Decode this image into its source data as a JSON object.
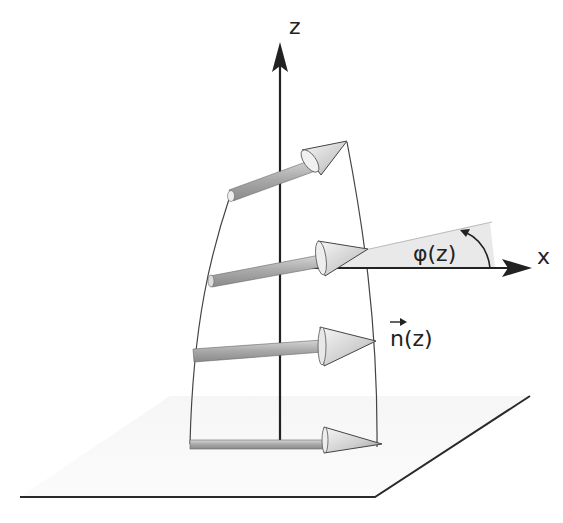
{
  "diagram": {
    "type": "twisted director field along z axis",
    "labels": {
      "z_axis": "z",
      "x_axis": "x",
      "angle": "φ(z)",
      "director": "n(z)"
    },
    "elements": {
      "axes": [
        "z (vertical)",
        "x (horizontal)"
      ],
      "director_arrows": 4,
      "base_plane": "ground plane (parallelogram)",
      "angle_sector": "shaded wedge between x axis and director"
    },
    "colors": {
      "line": "#222222",
      "arrow_shaft": "#b0b0b0",
      "arrow_head": "#d8d8d8",
      "shading": "#ececec"
    }
  }
}
